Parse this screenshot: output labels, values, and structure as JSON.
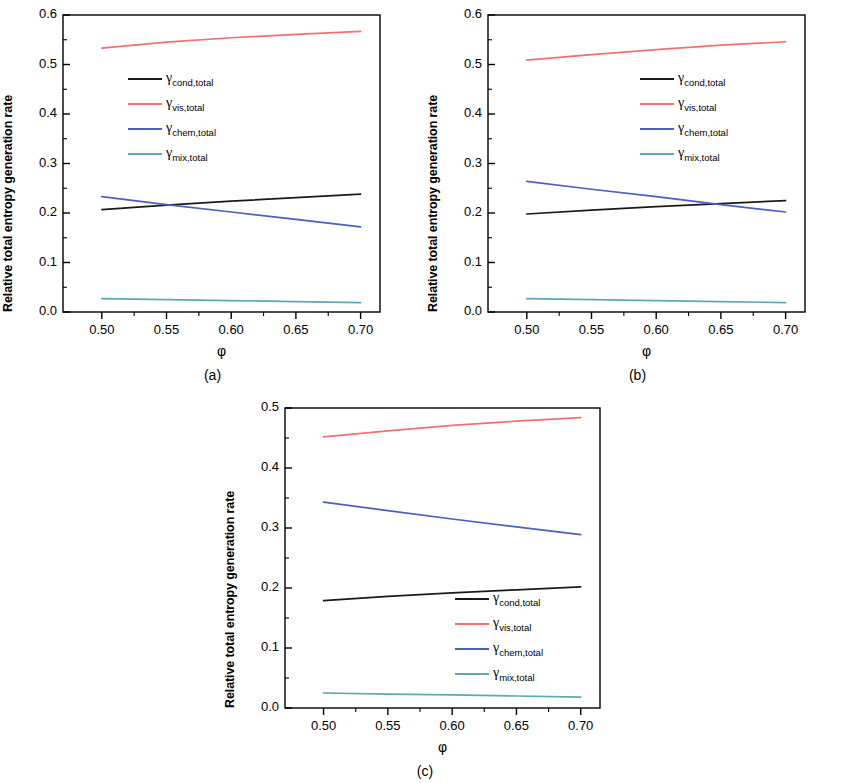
{
  "figure": {
    "axis_label_y": "Relative total entropy generation rate",
    "axis_label_x": "φ",
    "captions": {
      "a": "(a)",
      "b": "(b)",
      "c": "(c)"
    }
  },
  "colors": {
    "cond": "#1a1a1a",
    "vis": "#f2706d",
    "chem": "#4a5fc1",
    "mix": "#5aa8b8",
    "axis": "#000000"
  },
  "legend_entries": [
    {
      "key": "cond",
      "symbol": "γ",
      "sub": "cond,total",
      "color": "#1a1a1a"
    },
    {
      "key": "vis",
      "symbol": "γ",
      "sub": "vis,total",
      "color": "#f2706d"
    },
    {
      "key": "chem",
      "symbol": "γ",
      "sub": "chem,total",
      "color": "#4a5fc1"
    },
    {
      "key": "mix",
      "symbol": "γ",
      "sub": "mix,total",
      "color": "#5aa8b8"
    }
  ],
  "chart_data": [
    {
      "panel": "a",
      "type": "line",
      "title": "(a)",
      "xlabel": "φ",
      "ylabel": "Relative total entropy generation rate",
      "xlim": [
        0.47,
        0.715
      ],
      "ylim": [
        0.0,
        0.6
      ],
      "xticks": [
        0.5,
        0.55,
        0.6,
        0.65,
        0.7
      ],
      "xtick_labels": [
        "0.50",
        "0.55",
        "0.60",
        "0.65",
        "0.70"
      ],
      "yticks": [
        0.0,
        0.1,
        0.2,
        0.3,
        0.4,
        0.5,
        0.6
      ],
      "ytick_labels": [
        "0.0",
        "0.1",
        "0.2",
        "0.3",
        "0.4",
        "0.5",
        "0.6"
      ],
      "grid": false,
      "legend_position": "upper-left",
      "x": [
        0.5,
        0.55,
        0.6,
        0.65,
        0.7
      ],
      "series": [
        {
          "name": "γ cond,total",
          "key": "cond",
          "color": "#1a1a1a",
          "values": [
            0.207,
            0.216,
            0.224,
            0.231,
            0.238
          ]
        },
        {
          "name": "γ vis,total",
          "key": "vis",
          "color": "#f2706d",
          "values": [
            0.533,
            0.545,
            0.554,
            0.561,
            0.567
          ]
        },
        {
          "name": "γ chem,total",
          "key": "chem",
          "color": "#4a5fc1",
          "values": [
            0.233,
            0.217,
            0.202,
            0.187,
            0.172
          ]
        },
        {
          "name": "γ mix,total",
          "key": "mix",
          "color": "#5aa8b8",
          "values": [
            0.027,
            0.025,
            0.023,
            0.021,
            0.019
          ]
        }
      ]
    },
    {
      "panel": "b",
      "type": "line",
      "title": "(b)",
      "xlabel": "φ",
      "ylabel": "Relative total entropy generation rate",
      "xlim": [
        0.47,
        0.715
      ],
      "ylim": [
        0.0,
        0.6
      ],
      "xticks": [
        0.5,
        0.55,
        0.6,
        0.65,
        0.7
      ],
      "xtick_labels": [
        "0.50",
        "0.55",
        "0.60",
        "0.65",
        "0.70"
      ],
      "yticks": [
        0.0,
        0.1,
        0.2,
        0.3,
        0.4,
        0.5,
        0.6
      ],
      "ytick_labels": [
        "0.0",
        "0.1",
        "0.2",
        "0.3",
        "0.4",
        "0.5",
        "0.6"
      ],
      "grid": false,
      "legend_position": "upper-right",
      "x": [
        0.5,
        0.55,
        0.6,
        0.65,
        0.7
      ],
      "series": [
        {
          "name": "γ cond,total",
          "key": "cond",
          "color": "#1a1a1a",
          "values": [
            0.198,
            0.206,
            0.213,
            0.219,
            0.225
          ]
        },
        {
          "name": "γ vis,total",
          "key": "vis",
          "color": "#f2706d",
          "values": [
            0.509,
            0.52,
            0.53,
            0.539,
            0.546
          ]
        },
        {
          "name": "γ chem,total",
          "key": "chem",
          "color": "#4a5fc1",
          "values": [
            0.264,
            0.248,
            0.233,
            0.217,
            0.202
          ]
        },
        {
          "name": "γ mix,total",
          "key": "mix",
          "color": "#5aa8b8",
          "values": [
            0.027,
            0.025,
            0.023,
            0.021,
            0.019
          ]
        }
      ]
    },
    {
      "panel": "c",
      "type": "line",
      "title": "(c)",
      "xlabel": "φ",
      "ylabel": "Relative total entropy generation rate",
      "xlim": [
        0.47,
        0.715
      ],
      "ylim": [
        0.0,
        0.5
      ],
      "xticks": [
        0.5,
        0.55,
        0.6,
        0.65,
        0.7
      ],
      "xtick_labels": [
        "0.50",
        "0.55",
        "0.60",
        "0.65",
        "0.70"
      ],
      "yticks": [
        0.0,
        0.1,
        0.2,
        0.3,
        0.4,
        0.5
      ],
      "ytick_labels": [
        "0.0",
        "0.1",
        "0.2",
        "0.3",
        "0.4",
        "0.5"
      ],
      "grid": false,
      "legend_position": "lower-right",
      "x": [
        0.5,
        0.55,
        0.6,
        0.65,
        0.7
      ],
      "series": [
        {
          "name": "γ cond,total",
          "key": "cond",
          "color": "#1a1a1a",
          "values": [
            0.179,
            0.186,
            0.192,
            0.197,
            0.202
          ]
        },
        {
          "name": "γ vis,total",
          "key": "vis",
          "color": "#f2706d",
          "values": [
            0.452,
            0.462,
            0.471,
            0.478,
            0.484
          ]
        },
        {
          "name": "γ chem,total",
          "key": "chem",
          "color": "#4a5fc1",
          "values": [
            0.343,
            0.329,
            0.315,
            0.302,
            0.289
          ]
        },
        {
          "name": "γ mix,total",
          "key": "mix",
          "color": "#5aa8b8",
          "values": [
            0.025,
            0.023,
            0.022,
            0.02,
            0.018
          ]
        }
      ]
    }
  ]
}
